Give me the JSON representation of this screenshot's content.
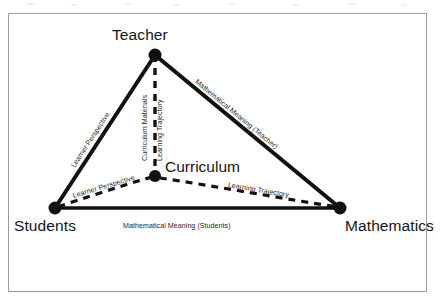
{
  "figure": {
    "background_color": "#ffffff",
    "frame_color": "#9a9a9f",
    "ink_color": "#111111"
  },
  "nodes": [
    {
      "id": "teacher",
      "label": "Teacher",
      "x": 155,
      "y": 55,
      "radius": 6.5
    },
    {
      "id": "students",
      "label": "Students",
      "x": 55,
      "y": 208,
      "radius": 6.5
    },
    {
      "id": "mathematics",
      "label": "Mathematics",
      "x": 340,
      "y": 208,
      "radius": 6.5
    },
    {
      "id": "curriculum",
      "label": "Curriculum",
      "x": 155,
      "y": 176,
      "radius": 6.0
    }
  ],
  "edges": [
    {
      "id": "teacher-students",
      "label": "Learner Perspective",
      "style": "solid",
      "from": "teacher",
      "to": "students"
    },
    {
      "id": "teacher-mathematics",
      "label": "Mathematical Meaning (Teacher)",
      "style": "solid",
      "from": "teacher",
      "to": "mathematics"
    },
    {
      "id": "students-mathematics",
      "label": "Mathematical Meaning (Students)",
      "style": "solid",
      "from": "students",
      "to": "mathematics"
    },
    {
      "id": "teacher-curriculum-materials",
      "label": "Curriculum Materials",
      "style": "dashed",
      "from": "teacher",
      "to": "curriculum"
    },
    {
      "id": "teacher-curriculum-trajectory",
      "label": "Learning Trajectory",
      "style": "dashed",
      "from": "teacher",
      "to": "curriculum"
    },
    {
      "id": "curriculum-students",
      "label": "Learner Perspective",
      "style": "dashed",
      "from": "curriculum",
      "to": "students"
    },
    {
      "id": "curriculum-mathematics",
      "label": "Learning Trajectory",
      "style": "dashed",
      "from": "curriculum",
      "to": "mathematics"
    }
  ]
}
